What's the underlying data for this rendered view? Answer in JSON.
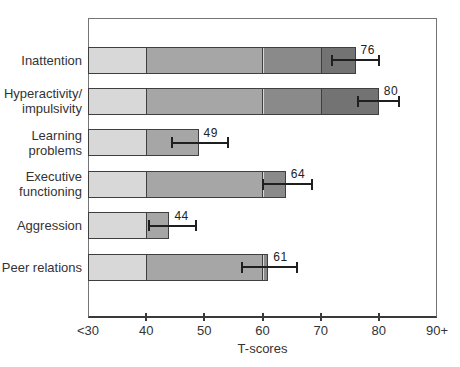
{
  "chart_data": {
    "type": "bar",
    "orientation": "horizontal",
    "title": "",
    "xlabel": "T-scores",
    "xlim": [
      30,
      90
    ],
    "grid": false,
    "legend": false,
    "x_ticks": [
      {
        "value": 30,
        "label": "<30",
        "mark": false
      },
      {
        "value": 40,
        "label": "40",
        "mark": true
      },
      {
        "value": 50,
        "label": "50",
        "mark": true
      },
      {
        "value": 60,
        "label": "60",
        "mark": true
      },
      {
        "value": 70,
        "label": "70",
        "mark": true
      },
      {
        "value": 80,
        "label": "80",
        "mark": true
      },
      {
        "value": 90,
        "label": "90+",
        "mark": false
      }
    ],
    "zones": [
      {
        "from": 30,
        "to": 40,
        "color": "#d8d8d8"
      },
      {
        "from": 40,
        "to": 60,
        "color": "#a6a6a6"
      },
      {
        "from": 60,
        "to": 70,
        "color": "#8a8a8a"
      },
      {
        "from": 70,
        "to": 90,
        "color": "#737373"
      }
    ],
    "categories": [
      "Inattention",
      "Hyperactivity/\nimpulsivity",
      "Learning\nproblems",
      "Executive\nfunctioning",
      "Aggression",
      "Peer relations"
    ],
    "values": [
      76,
      80,
      49,
      64,
      44,
      61
    ],
    "error_low": [
      72,
      76.5,
      44.5,
      60,
      40.5,
      56.5
    ],
    "error_high": [
      80,
      83.5,
      54,
      68.5,
      48.5,
      66
    ],
    "colors": {
      "bar_outline": "#3f3f3f",
      "error_bar": "#1f1f1f",
      "text": "#333333",
      "plot_border": "#757575",
      "axis": "#3a3a3a",
      "background": "#ffffff"
    }
  }
}
